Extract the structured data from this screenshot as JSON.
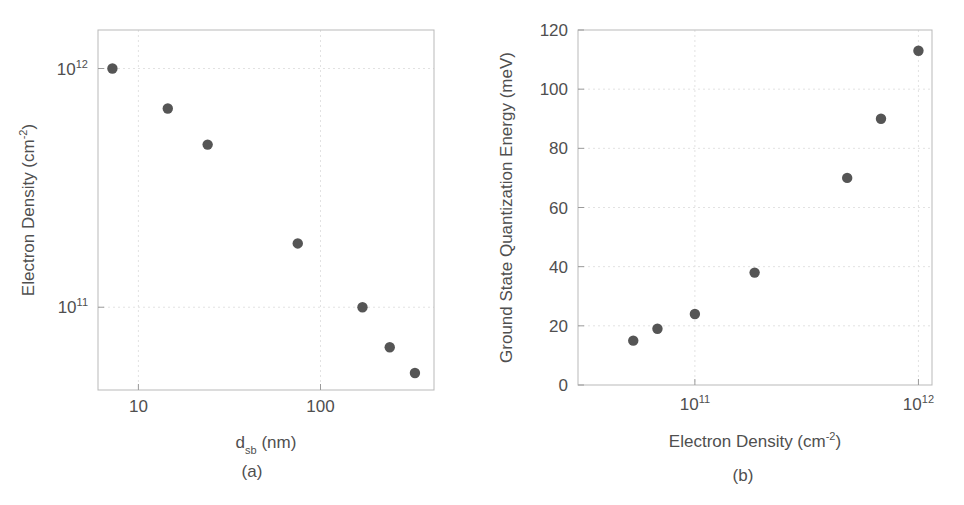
{
  "figure": {
    "background": "#ffffff",
    "marker_color": "#555555",
    "axis_color": "#b9b9b9",
    "text_color": "#4f4f4f"
  },
  "panels": [
    {
      "id": "a",
      "caption": "(a)",
      "chart_data": {
        "type": "scatter",
        "title": "",
        "xlabel": "d_sb (nm)",
        "xlabel_parts": {
          "base": "d",
          "sub": "sb",
          "unit": "(nm)"
        },
        "ylabel": "Electron Density (cm-2)",
        "ylabel_parts": {
          "base": "Electron Density (cm",
          "sup": "-2",
          "tail": ")"
        },
        "xscale": "log",
        "yscale": "log",
        "xlim": [
          6,
          420
        ],
        "ylim": [
          45000000000,
          1450000000000
        ],
        "xticks": [
          10,
          100
        ],
        "xticklabels": [
          "10",
          "100"
        ],
        "yticks": [
          100000000000,
          1000000000000
        ],
        "yticklabels": [
          "10^11",
          "10^12"
        ],
        "ytick_parts": [
          {
            "base": "10",
            "sup": "11"
          },
          {
            "base": "10",
            "sup": "12"
          }
        ],
        "grid": true,
        "legend": "none",
        "x": [
          7.2,
          14.5,
          24,
          75,
          170,
          240,
          330
        ],
        "y": [
          1000000000000,
          680000000000,
          480000000000,
          185000000000,
          100000000000,
          68000000000,
          53000000000
        ],
        "points": [
          {
            "x": 7.2,
            "y": 1000000000000.0
          },
          {
            "x": 14.5,
            "y": 680000000000.0
          },
          {
            "x": 24,
            "y": 480000000000.0
          },
          {
            "x": 75,
            "y": 185000000000.0
          },
          {
            "x": 170,
            "y": 100000000000.0
          },
          {
            "x": 240,
            "y": 68000000000.0
          },
          {
            "x": 330,
            "y": 53000000000.0
          }
        ]
      }
    },
    {
      "id": "b",
      "caption": "(b)",
      "chart_data": {
        "type": "scatter",
        "title": "",
        "xlabel": "Electron Density (cm-2)",
        "xlabel_parts": {
          "base": "Electron Density (cm",
          "sup": "-2",
          "tail": ")"
        },
        "ylabel": "Ground State Quantization Energy (meV)",
        "xscale": "log",
        "yscale": "linear",
        "xlim": [
          30000000000,
          1150000000000
        ],
        "ylim": [
          0,
          120
        ],
        "xticks": [
          100000000000,
          1000000000000
        ],
        "xticklabels": [
          "10^11",
          "10^12"
        ],
        "xtick_parts": [
          {
            "base": "10",
            "sup": "11"
          },
          {
            "base": "10",
            "sup": "12"
          }
        ],
        "yticks": [
          0,
          20,
          40,
          60,
          80,
          100,
          120
        ],
        "yticklabels": [
          "0",
          "20",
          "40",
          "60",
          "80",
          "100",
          "120"
        ],
        "grid": true,
        "legend": "none",
        "x": [
          53000000000,
          68000000000,
          100000000000,
          185000000000,
          480000000000,
          680000000000,
          1000000000000
        ],
        "y": [
          15,
          19,
          24,
          38,
          70,
          90,
          113
        ],
        "points": [
          {
            "x": 53000000000.0,
            "y": 15
          },
          {
            "x": 68000000000.0,
            "y": 19
          },
          {
            "x": 100000000000.0,
            "y": 24
          },
          {
            "x": 185000000000.0,
            "y": 38
          },
          {
            "x": 480000000000.0,
            "y": 70
          },
          {
            "x": 680000000000.0,
            "y": 90
          },
          {
            "x": 1000000000000.0,
            "y": 113
          }
        ]
      }
    }
  ]
}
